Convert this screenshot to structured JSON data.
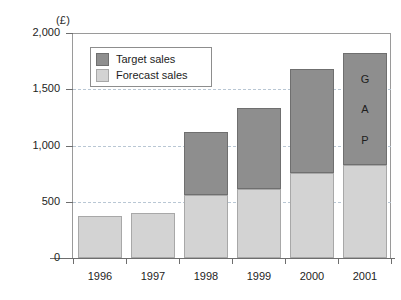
{
  "chart_data": {
    "type": "bar",
    "title": "",
    "subtitle": "",
    "xlabel": "",
    "ylabel": "",
    "unit_label": "(£)",
    "categories": [
      "1996",
      "1997",
      "1998",
      "1999",
      "2000",
      "2001"
    ],
    "series": [
      {
        "name": "Forecast sales",
        "color": "#d3d3d3",
        "values": [
          370,
          400,
          560,
          610,
          760,
          830
        ]
      },
      {
        "name": "Target sales",
        "color": "#8e8e8e",
        "values": [
          0,
          0,
          560,
          720,
          920,
          990
        ]
      }
    ],
    "stacked": true,
    "totals": [
      370,
      400,
      1120,
      1330,
      1680,
      1820
    ],
    "ylim": [
      0,
      2000
    ],
    "yticks": [
      0,
      500,
      1000,
      1500,
      2000
    ],
    "ytick_labels": [
      "0",
      "500",
      "1,000",
      "1,500",
      "2,000"
    ],
    "grid": true,
    "grid_axis": "y",
    "grid_style": "dashed",
    "legend_position": "upper-left-inside",
    "annotations": [
      {
        "name": "gap-annotation",
        "text": "GAP",
        "letters": [
          "G",
          "A",
          "P"
        ],
        "category": "2001",
        "segment": "Target sales"
      }
    ]
  },
  "legend": {
    "items": [
      {
        "label": "Target sales",
        "color": "#8e8e8e"
      },
      {
        "label": "Forecast sales",
        "color": "#d3d3d3"
      }
    ]
  }
}
